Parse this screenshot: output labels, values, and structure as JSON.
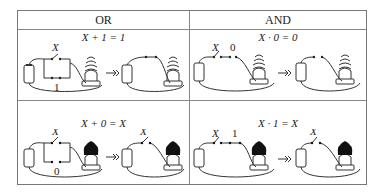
{
  "table": {
    "headers": [
      "OR",
      "AND"
    ],
    "cells": [
      {
        "column": "OR",
        "row": 1,
        "equation": "X + 1 = 1",
        "switch_label": "X",
        "constant_label": "1",
        "bulb": "on"
      },
      {
        "column": "AND",
        "row": 1,
        "equation": "X · 0 = 0",
        "switch_label": "X",
        "constant_label": "0",
        "bulb": "off"
      },
      {
        "column": "OR",
        "row": 2,
        "equation": "X + 0 = X",
        "switch_label": "X",
        "constant_label": "0",
        "bulb": "dark"
      },
      {
        "column": "AND",
        "row": 2,
        "equation": "X · 1 = X",
        "switch_label": "X",
        "constant_label": "1",
        "bulb": "dark"
      }
    ],
    "arrow": "→»"
  }
}
